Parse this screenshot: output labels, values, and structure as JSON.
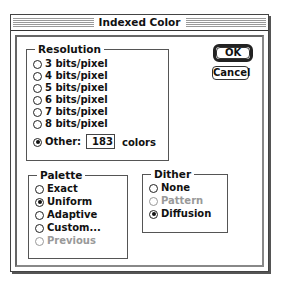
{
  "window": {
    "title": "Indexed Color"
  },
  "resolution": {
    "label": "Resolution",
    "options": [
      {
        "label": "3 bits/pixel",
        "selected": false,
        "disabled": false
      },
      {
        "label": "4 bits/pixel",
        "selected": false,
        "disabled": false
      },
      {
        "label": "5 bits/pixel",
        "selected": false,
        "disabled": false
      },
      {
        "label": "6 bits/pixel",
        "selected": false,
        "disabled": false
      },
      {
        "label": "7 bits/pixel",
        "selected": false,
        "disabled": false
      },
      {
        "label": "8 bits/pixel",
        "selected": false,
        "disabled": false
      },
      {
        "label": "Other:",
        "selected": true,
        "disabled": false
      }
    ],
    "other_value": "183",
    "other_suffix": "colors"
  },
  "palette": {
    "label": "Palette",
    "options": [
      {
        "label": "Exact",
        "selected": false,
        "disabled": false
      },
      {
        "label": "Uniform",
        "selected": true,
        "disabled": false
      },
      {
        "label": "Adaptive",
        "selected": false,
        "disabled": false
      },
      {
        "label": "Custom...",
        "selected": false,
        "disabled": false
      },
      {
        "label": "Previous",
        "selected": false,
        "disabled": true
      }
    ]
  },
  "dither": {
    "label": "Dither",
    "options": [
      {
        "label": "None",
        "selected": false,
        "disabled": false
      },
      {
        "label": "Pattern",
        "selected": false,
        "disabled": true
      },
      {
        "label": "Diffusion",
        "selected": true,
        "disabled": false
      }
    ]
  },
  "buttons": {
    "ok": "OK",
    "cancel": "Cancel"
  }
}
